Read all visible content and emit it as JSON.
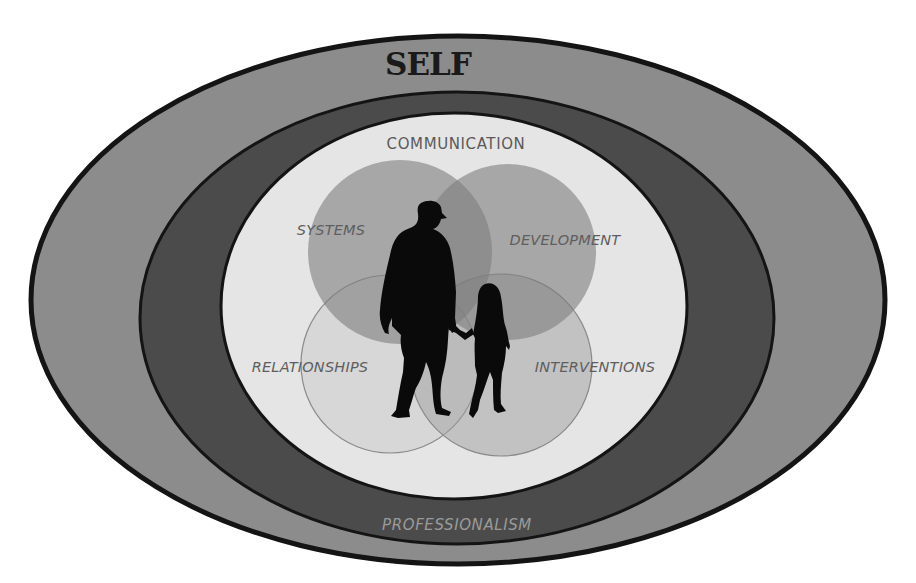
{
  "diagram": {
    "title": "SELF",
    "rings": {
      "outer": {
        "label": "SELF",
        "fill": "#8c8c8c",
        "stroke": "#141414"
      },
      "middle": {
        "label": "PROFESSIONALISM",
        "fill": "#4a4a4a",
        "stroke": "#141414",
        "label_color": "#9a9a9a"
      },
      "inner": {
        "label": "COMMUNICATION",
        "fill": "#e6e6e6",
        "stroke": "#141414",
        "label_color": "#5a5a5a"
      }
    },
    "circles": [
      {
        "id": "systems",
        "label": "SYSTEMS",
        "fill": "#8a8a8a",
        "opacity": 0.55
      },
      {
        "id": "development",
        "label": "DEVELOPMENT",
        "fill": "#8a8a8a",
        "opacity": 0.55
      },
      {
        "id": "relationships",
        "label": "RELATIONSHIPS",
        "fill": "#bdbdbd",
        "opacity": 0.35
      },
      {
        "id": "interventions",
        "label": "INTERVENTIONS",
        "fill": "#a3a3a3",
        "opacity": 0.45
      }
    ],
    "center_image": "silhouette-adult-and-child-holding-hands"
  }
}
